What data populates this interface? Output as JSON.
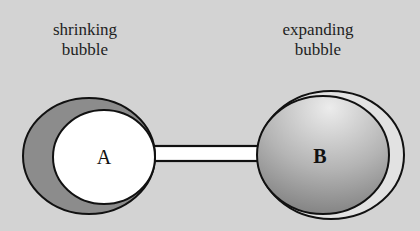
{
  "labels": {
    "left": [
      "shrinking",
      "bubble"
    ],
    "right": [
      "expanding",
      "bubble"
    ]
  },
  "bubbles": {
    "a": {
      "letter": "A",
      "state": "shrinking"
    },
    "b": {
      "letter": "B",
      "state": "expanding"
    }
  },
  "colors": {
    "background": "#d3d3d3",
    "outline": "#111111",
    "shrink_shadow": "#8c8c8c",
    "bubble_a_fill": "#ffffff",
    "bubble_b_light": "#e6e6e6",
    "bubble_b_dark": "#8a8a8a",
    "tube_fill": "#ffffff"
  }
}
